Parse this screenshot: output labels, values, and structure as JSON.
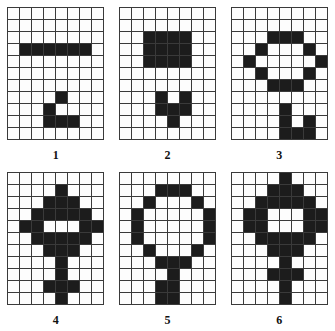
{
  "figure": {
    "title": "",
    "grid_columns": 8,
    "grid_rows": 11,
    "cell_on_color": "#1c1c1c",
    "cell_off_color": "#fdfdfd",
    "grid_line_color": "#3a3a3a"
  },
  "panels": [
    {
      "label": "1",
      "cells": [
        [
          0,
          0,
          0,
          0,
          0,
          0,
          0,
          0
        ],
        [
          0,
          0,
          0,
          0,
          0,
          0,
          0,
          0
        ],
        [
          0,
          0,
          0,
          0,
          0,
          0,
          0,
          0
        ],
        [
          0,
          1,
          1,
          1,
          1,
          1,
          1,
          0
        ],
        [
          0,
          0,
          0,
          0,
          0,
          0,
          0,
          0
        ],
        [
          0,
          0,
          0,
          0,
          0,
          0,
          0,
          0
        ],
        [
          0,
          0,
          0,
          0,
          0,
          0,
          0,
          0
        ],
        [
          0,
          0,
          0,
          0,
          1,
          0,
          0,
          0
        ],
        [
          0,
          0,
          0,
          1,
          0,
          0,
          0,
          0
        ],
        [
          0,
          0,
          0,
          1,
          1,
          1,
          0,
          0
        ],
        [
          0,
          0,
          0,
          0,
          0,
          0,
          0,
          0
        ]
      ]
    },
    {
      "label": "2",
      "cells": [
        [
          0,
          0,
          0,
          0,
          0,
          0,
          0,
          0
        ],
        [
          0,
          0,
          0,
          0,
          0,
          0,
          0,
          0
        ],
        [
          0,
          0,
          1,
          1,
          1,
          1,
          0,
          0
        ],
        [
          0,
          0,
          1,
          1,
          1,
          1,
          0,
          0
        ],
        [
          0,
          0,
          1,
          1,
          1,
          1,
          0,
          0
        ],
        [
          0,
          0,
          0,
          0,
          0,
          0,
          0,
          0
        ],
        [
          0,
          0,
          0,
          0,
          0,
          0,
          0,
          0
        ],
        [
          0,
          0,
          0,
          1,
          0,
          1,
          0,
          0
        ],
        [
          0,
          0,
          0,
          1,
          1,
          1,
          0,
          0
        ],
        [
          0,
          0,
          0,
          0,
          1,
          0,
          0,
          0
        ],
        [
          0,
          0,
          0,
          0,
          0,
          0,
          0,
          0
        ]
      ]
    },
    {
      "label": "3",
      "cells": [
        [
          0,
          0,
          0,
          0,
          0,
          0,
          0,
          0
        ],
        [
          0,
          0,
          0,
          0,
          0,
          0,
          0,
          0
        ],
        [
          0,
          0,
          0,
          1,
          1,
          1,
          0,
          0
        ],
        [
          0,
          0,
          1,
          0,
          0,
          0,
          1,
          0
        ],
        [
          0,
          1,
          0,
          0,
          0,
          0,
          0,
          1
        ],
        [
          0,
          0,
          1,
          0,
          0,
          0,
          1,
          0
        ],
        [
          0,
          0,
          0,
          1,
          1,
          1,
          0,
          0
        ],
        [
          0,
          0,
          0,
          0,
          0,
          0,
          0,
          0
        ],
        [
          0,
          0,
          0,
          0,
          1,
          0,
          0,
          0
        ],
        [
          0,
          0,
          0,
          0,
          1,
          0,
          1,
          0
        ],
        [
          0,
          0,
          0,
          0,
          1,
          1,
          1,
          0
        ]
      ]
    },
    {
      "label": "4",
      "cells": [
        [
          0,
          0,
          0,
          0,
          0,
          0,
          0,
          0
        ],
        [
          0,
          0,
          0,
          0,
          1,
          0,
          0,
          0
        ],
        [
          0,
          0,
          0,
          1,
          1,
          1,
          0,
          0
        ],
        [
          0,
          0,
          1,
          1,
          1,
          1,
          1,
          0
        ],
        [
          0,
          1,
          1,
          0,
          0,
          0,
          1,
          1
        ],
        [
          0,
          0,
          1,
          1,
          1,
          1,
          1,
          0
        ],
        [
          0,
          0,
          0,
          1,
          1,
          1,
          0,
          0
        ],
        [
          0,
          0,
          0,
          0,
          1,
          0,
          0,
          0
        ],
        [
          0,
          0,
          0,
          0,
          1,
          0,
          0,
          0
        ],
        [
          0,
          0,
          0,
          1,
          1,
          1,
          0,
          0
        ],
        [
          0,
          0,
          0,
          0,
          1,
          0,
          0,
          0
        ]
      ]
    },
    {
      "label": "5",
      "cells": [
        [
          0,
          0,
          0,
          0,
          0,
          0,
          0,
          0
        ],
        [
          0,
          0,
          0,
          1,
          1,
          1,
          0,
          0
        ],
        [
          0,
          0,
          1,
          0,
          0,
          0,
          1,
          0
        ],
        [
          0,
          1,
          0,
          0,
          0,
          0,
          0,
          1
        ],
        [
          0,
          1,
          0,
          0,
          0,
          0,
          0,
          1
        ],
        [
          0,
          1,
          0,
          0,
          0,
          0,
          0,
          1
        ],
        [
          0,
          0,
          1,
          0,
          0,
          0,
          1,
          0
        ],
        [
          0,
          0,
          0,
          1,
          1,
          1,
          0,
          0
        ],
        [
          0,
          0,
          0,
          0,
          1,
          0,
          0,
          0
        ],
        [
          0,
          0,
          0,
          1,
          1,
          0,
          0,
          0
        ],
        [
          0,
          0,
          0,
          1,
          1,
          0,
          0,
          0
        ]
      ]
    },
    {
      "label": "6",
      "cells": [
        [
          0,
          0,
          0,
          0,
          1,
          0,
          0,
          0
        ],
        [
          0,
          0,
          0,
          1,
          1,
          1,
          0,
          0
        ],
        [
          0,
          0,
          1,
          1,
          1,
          1,
          1,
          0
        ],
        [
          0,
          1,
          1,
          0,
          0,
          0,
          1,
          1
        ],
        [
          0,
          1,
          1,
          0,
          0,
          0,
          1,
          1
        ],
        [
          0,
          0,
          1,
          1,
          1,
          1,
          1,
          0
        ],
        [
          0,
          0,
          0,
          1,
          1,
          1,
          0,
          0
        ],
        [
          0,
          0,
          0,
          0,
          1,
          0,
          0,
          0
        ],
        [
          0,
          0,
          0,
          1,
          1,
          1,
          0,
          0
        ],
        [
          0,
          0,
          0,
          0,
          1,
          0,
          0,
          0
        ],
        [
          0,
          0,
          0,
          0,
          1,
          0,
          0,
          0
        ]
      ]
    }
  ]
}
